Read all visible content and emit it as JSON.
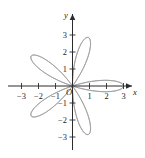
{
  "figure": {
    "kind": "polar-rose-plot",
    "origin_label": "O",
    "stroke_color": "#8f8f8f",
    "axis_color": "#2b2b2b",
    "background_color": "#ffffff"
  },
  "axes": {
    "x_axis_name": "x",
    "y_axis_name": "y",
    "x_ticks": [
      {
        "value": -3,
        "label": "−3"
      },
      {
        "value": -2,
        "label": "−2"
      },
      {
        "value": -1,
        "label": "−1"
      },
      {
        "value": 1,
        "label": "1"
      },
      {
        "value": 2,
        "label": "2"
      },
      {
        "value": 3,
        "label": "3"
      }
    ],
    "y_ticks": [
      {
        "value": 3,
        "label": "3"
      },
      {
        "value": 2,
        "label": "2"
      },
      {
        "value": 1,
        "label": "1"
      },
      {
        "value": -1,
        "label": "−1"
      },
      {
        "value": -2,
        "label": "−2"
      },
      {
        "value": -3,
        "label": "−3"
      }
    ]
  },
  "chart_data": {
    "type": "line",
    "title": "",
    "subtitle": "",
    "xlabel": "x",
    "ylabel": "y",
    "xlim": [
      -3.6,
      3.6
    ],
    "ylim": [
      -3.6,
      3.6
    ],
    "grid": false,
    "legend": null,
    "coordinate_system": "polar-on-cartesian",
    "curve": {
      "name": "rose curve",
      "equation": "r = 3 cos(5θ)",
      "amplitude": 3,
      "petal_parameter_k": 5,
      "petal_count": 10,
      "theta_range_deg": [
        0,
        360
      ],
      "petal_tip_radius": 3,
      "petal_tip_angles_deg": [
        0,
        36,
        72,
        108,
        144,
        180,
        216,
        252,
        288,
        324
      ]
    },
    "annotations": [
      {
        "text": "O",
        "x": 0,
        "y": 0,
        "role": "origin-marker"
      },
      {
        "text": "x",
        "x": 3.55,
        "y": -0.3,
        "role": "x-axis-name"
      },
      {
        "text": "y",
        "x": -0.35,
        "y": 3.5,
        "role": "y-axis-name"
      }
    ],
    "x_tick_values": [
      -3,
      -2,
      -1,
      1,
      2,
      3
    ],
    "y_tick_values": [
      -3,
      -2,
      -1,
      1,
      2,
      3
    ],
    "x_tick_labels": [
      "−3",
      "−2",
      "−1",
      "1",
      "2",
      "3"
    ],
    "y_tick_labels": [
      "−3",
      "−2",
      "−1",
      "1",
      "2",
      "3"
    ]
  }
}
